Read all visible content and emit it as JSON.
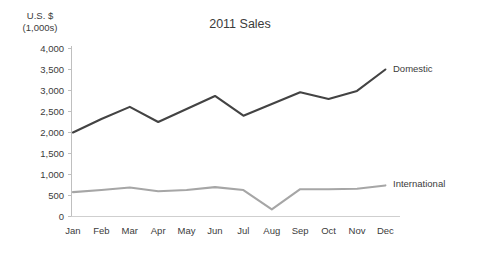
{
  "chart_data": {
    "type": "line",
    "title": "2011 Sales",
    "xlabel": "",
    "ylabel": "U.S. $",
    "ylabel_line2": "(1,000s)",
    "categories": [
      "Jan",
      "Feb",
      "Mar",
      "Apr",
      "May",
      "Jun",
      "Jul",
      "Aug",
      "Sep",
      "Oct",
      "Nov",
      "Dec"
    ],
    "series": [
      {
        "name": "Domestic",
        "color": "#434343",
        "values": [
          2000,
          2320,
          2610,
          2250,
          2560,
          2870,
          2400,
          2680,
          2960,
          2800,
          2990,
          3500
        ]
      },
      {
        "name": "International",
        "color": "#a6a6a6",
        "values": [
          580,
          630,
          690,
          600,
          630,
          700,
          630,
          170,
          650,
          650,
          660,
          740
        ]
      }
    ],
    "ylim": [
      0,
      4000
    ],
    "yticks": [
      "0",
      "500",
      "1,000",
      "1,500",
      "2,000",
      "2,500",
      "3,000",
      "3,500",
      "4,000"
    ],
    "ytick_values": [
      0,
      500,
      1000,
      1500,
      2000,
      2500,
      3000,
      3500,
      4000
    ],
    "grid": false,
    "legend_position": "right-of-line-end",
    "axis_color": "#bfbfbf",
    "text_color": "#3b3b3b",
    "background": "#ffffff"
  }
}
